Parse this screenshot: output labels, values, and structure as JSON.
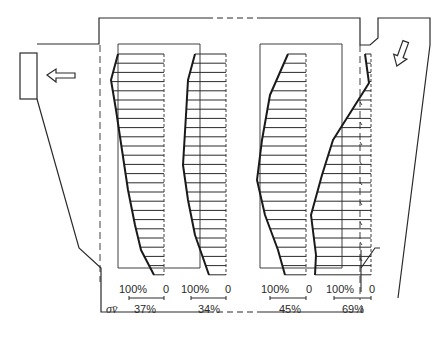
{
  "diagram": {
    "type": "velocity-profile-schematic",
    "stroke_color": "#2a2a2a",
    "background": "#ffffff",
    "arrows": [
      {
        "id": "outlet-arrow",
        "direction": "left"
      },
      {
        "id": "inlet-arrow",
        "direction": "down-left"
      }
    ],
    "axis_labels": {
      "sigma_label": "σv̄"
    },
    "profiles": [
      {
        "id": "profile-1",
        "scale_left": "100%",
        "scale_right": "0",
        "sigma": "37%"
      },
      {
        "id": "profile-2",
        "scale_left": "100%",
        "scale_right": "0",
        "sigma": "34%"
      },
      {
        "id": "profile-3",
        "scale_left": "100%",
        "scale_right": "0",
        "sigma": "45%"
      },
      {
        "id": "profile-4",
        "scale_left": "100%",
        "scale_right": "0",
        "sigma": "69%"
      }
    ]
  }
}
